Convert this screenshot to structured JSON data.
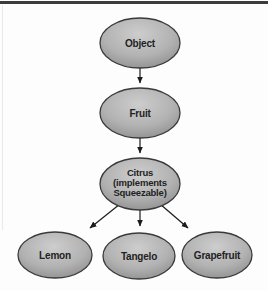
{
  "figure": {
    "background": "#fdfdfd",
    "top_rule_color": "#3c3c3c"
  },
  "diagram": {
    "kind": "inheritance-hierarchy",
    "nodes": {
      "object": {
        "label": "Object"
      },
      "fruit": {
        "label": "Fruit"
      },
      "citrus": {
        "label": "Citrus (implements Squeezable)",
        "lines": [
          "Citrus",
          "(implements",
          "Squeezable)"
        ]
      },
      "lemon": {
        "label": "Lemon"
      },
      "tangelo": {
        "label": "Tangelo"
      },
      "grapefruit": {
        "label": "Grapefruit"
      }
    },
    "edges": [
      {
        "from": "Object",
        "to": "Fruit"
      },
      {
        "from": "Fruit",
        "to": "Citrus"
      },
      {
        "from": "Citrus",
        "to": "Lemon"
      },
      {
        "from": "Citrus",
        "to": "Tangelo"
      },
      {
        "from": "Citrus",
        "to": "Grapefruit"
      }
    ],
    "colors": {
      "node_fill_light": "#cdcdcd",
      "node_fill_mid": "#b2b2b2",
      "node_fill_dark": "#878787",
      "node_stroke": "#3a3a3a",
      "arrow": "#1c1c1c",
      "text": "#222222"
    }
  }
}
